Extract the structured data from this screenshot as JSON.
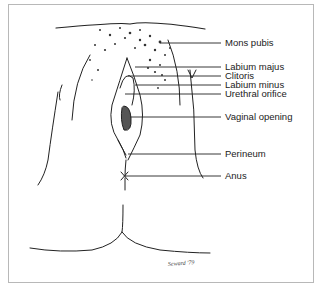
{
  "figure": {
    "labels": [
      {
        "id": "mons-pubis",
        "text": "Mons pubis",
        "y": 43,
        "line_start_x": 160
      },
      {
        "id": "labium-majus",
        "text": "Labium majus",
        "y": 67,
        "line_start_x": 135
      },
      {
        "id": "clitoris",
        "text": "Clitoris",
        "y": 76,
        "line_start_x": 128
      },
      {
        "id": "labium-minus",
        "text": "Labium minus",
        "y": 85,
        "line_start_x": 135
      },
      {
        "id": "urethral-orifice",
        "text": "Urethral orifice",
        "y": 94,
        "line_start_x": 125
      },
      {
        "id": "vaginal-opening",
        "text": "Vaginal opening",
        "y": 117,
        "line_start_x": 130
      },
      {
        "id": "perineum",
        "text": "Perineum",
        "y": 154,
        "line_start_x": 128
      },
      {
        "id": "anus",
        "text": "Anus",
        "y": 176,
        "line_start_x": 125
      }
    ],
    "signature": "Seward '79"
  }
}
